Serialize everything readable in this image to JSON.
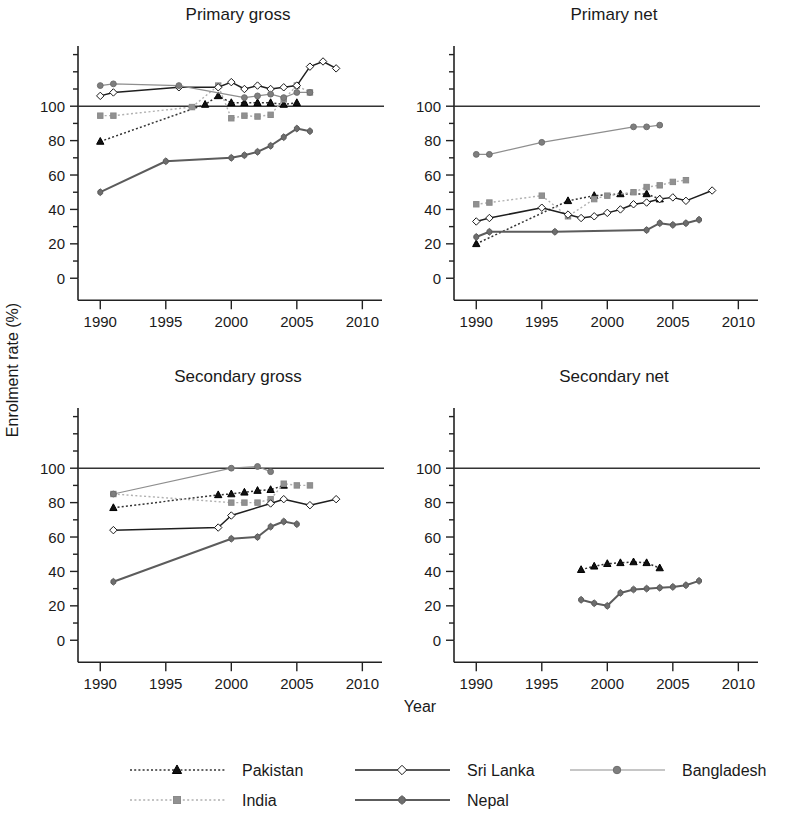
{
  "figure": {
    "ylabel": "Enrolment rate (%)",
    "xlabel": "Year"
  },
  "panels": [
    {
      "key": "primary_gross",
      "title": "Primary gross"
    },
    {
      "key": "primary_net",
      "title": "Primary net"
    },
    {
      "key": "secondary_gross",
      "title": "Secondary gross"
    },
    {
      "key": "secondary_net",
      "title": "Secondary net"
    }
  ],
  "legend": {
    "entries": [
      {
        "label": "Pakistan",
        "marker": "triangle",
        "marker_color": "#111111",
        "line_color": "#333333",
        "line_style": "dotted"
      },
      {
        "label": "Sri Lanka",
        "marker": "diamond",
        "marker_color": "#ffffff",
        "line_color": "#1a1a1a",
        "line_style": "solid"
      },
      {
        "label": "Bangladesh",
        "marker": "circle",
        "marker_color": "#7d7d7d",
        "line_color": "#8a8a8a",
        "line_style": "solid"
      },
      {
        "label": "India",
        "marker": "square",
        "marker_color": "#909090",
        "line_color": "#a8a8a8",
        "line_style": "dotted"
      },
      {
        "label": "Nepal",
        "marker": "sqdiamond",
        "marker_color": "#6f6f6f",
        "line_color": "#5f5f5f",
        "line_style": "solid"
      }
    ]
  },
  "axes": {
    "x_ticks": [
      1990,
      1995,
      2000,
      2005,
      2010
    ],
    "x_tick_labels": [
      "1990",
      "1995",
      "2000",
      "2005",
      "2010"
    ],
    "xlim": [
      1988.3,
      2011.5
    ],
    "y_ticks": [
      0,
      20,
      40,
      60,
      80,
      100
    ],
    "y_tick_labels": [
      "0",
      "20",
      "40",
      "60",
      "80",
      "100"
    ],
    "y_minor_ticks": [
      10,
      30,
      50,
      70,
      90,
      110,
      120,
      130
    ],
    "ylim": [
      -8,
      135
    ],
    "reference_line": 100
  },
  "chart_data": {
    "type": "line",
    "xlabel": "Year",
    "ylabel": "Enrolment rate (%)",
    "xlim": [
      1988.3,
      2011.5
    ],
    "ylim": [
      -8,
      135
    ],
    "grid": false,
    "legend_position": "bottom",
    "legend_entries": [
      "Pakistan",
      "India",
      "Sri Lanka",
      "Nepal",
      "Bangladesh"
    ],
    "reference_line_y": 100,
    "panels": [
      {
        "key": "primary_gross",
        "title": "Primary gross",
        "series": [
          {
            "name": "Pakistan",
            "x": [
              1990,
              1998,
              1999,
              2000,
              2001,
              2002,
              2003,
              2004,
              2005
            ],
            "values": [
              79.5,
              101,
              106,
              102,
              102,
              102,
              102,
              101,
              102
            ]
          },
          {
            "name": "India",
            "x": [
              1990,
              1991,
              1997,
              1999,
              2000,
              2001,
              2002,
              2003,
              2004,
              2005,
              2006
            ],
            "values": [
              94.5,
              94.5,
              99.5,
              112,
              93,
              94.5,
              94,
              95,
              104,
              112,
              108
            ]
          },
          {
            "name": "Sri Lanka",
            "x": [
              1990,
              1991,
              1996,
              1999,
              2000,
              2001,
              2002,
              2003,
              2004,
              2005,
              2006,
              2007,
              2008
            ],
            "values": [
              106,
              108,
              111,
              111,
              114,
              110,
              112,
              110,
              111,
              112,
              123,
              126,
              122
            ]
          },
          {
            "name": "Nepal",
            "x": [
              1990,
              1995,
              2000,
              2001,
              2002,
              2003,
              2004,
              2005,
              2006
            ],
            "values": [
              50,
              68,
              70,
              71.5,
              73.5,
              77,
              82,
              87,
              85.5
            ]
          },
          {
            "name": "Bangladesh",
            "x": [
              1990,
              1991,
              1996,
              2001,
              2002,
              2003,
              2004,
              2005,
              2006
            ],
            "values": [
              112,
              113,
              112,
              105,
              106,
              107,
              105,
              108,
              108
            ]
          }
        ]
      },
      {
        "key": "primary_net",
        "title": "Primary net",
        "series": [
          {
            "name": "Pakistan",
            "x": [
              1990,
              1997,
              1999,
              2001,
              2003,
              2004
            ],
            "values": [
              20,
              45,
              48,
              49,
              49,
              46
            ]
          },
          {
            "name": "India",
            "x": [
              1990,
              1991,
              1995,
              1997,
              1999,
              2000,
              2002,
              2003,
              2004,
              2005,
              2006
            ],
            "values": [
              43,
              44,
              48,
              36,
              46,
              48,
              50,
              53,
              54,
              56,
              57
            ]
          },
          {
            "name": "Sri Lanka",
            "x": [
              1990,
              1991,
              1995,
              1997,
              1998,
              1999,
              2000,
              2001,
              2002,
              2003,
              2004,
              2005,
              2006,
              2008
            ],
            "values": [
              33,
              35,
              41,
              37,
              35,
              36,
              38,
              40,
              43,
              44,
              46,
              47,
              45,
              51
            ]
          },
          {
            "name": "Nepal",
            "x": [
              1990,
              1991,
              1996,
              2003,
              2004,
              2005,
              2006,
              2007
            ],
            "values": [
              24,
              27,
              27,
              28,
              32,
              31,
              32,
              34
            ]
          },
          {
            "name": "Bangladesh",
            "x": [
              1990,
              1991,
              1995,
              2002,
              2003,
              2004
            ],
            "values": [
              72,
              72,
              79,
              88,
              88,
              89
            ]
          }
        ]
      },
      {
        "key": "secondary_gross",
        "title": "Secondary gross",
        "series": [
          {
            "name": "Pakistan",
            "x": [
              1991,
              1999,
              2000,
              2001,
              2002,
              2003,
              2004
            ],
            "values": [
              77,
              84.5,
              85,
              86,
              87,
              87.5,
              90
            ]
          },
          {
            "name": "India",
            "x": [
              1991,
              2000,
              2001,
              2002,
              2003,
              2004,
              2005,
              2006
            ],
            "values": [
              85,
              80,
              80,
              80,
              82,
              91,
              90,
              90
            ]
          },
          {
            "name": "Sri Lanka",
            "x": [
              1991,
              1999,
              2000,
              2003,
              2004,
              2006,
              2008
            ],
            "values": [
              64,
              65.5,
              72.5,
              79.5,
              82,
              78.5,
              82
            ]
          },
          {
            "name": "Nepal",
            "x": [
              1991,
              2000,
              2002,
              2003,
              2004,
              2005
            ],
            "values": [
              34,
              59,
              60,
              66,
              69,
              67.5
            ]
          },
          {
            "name": "Bangladesh",
            "x": [
              1991,
              2000,
              2002,
              2003
            ],
            "values": [
              85,
              100,
              101,
              98
            ]
          }
        ]
      },
      {
        "key": "secondary_net",
        "title": "Secondary net",
        "series": [
          {
            "name": "Pakistan",
            "x": [
              1998,
              1999,
              2000,
              2001,
              2002,
              2003,
              2004
            ],
            "values": [
              41,
              43,
              44.5,
              45,
              45.5,
              45,
              42
            ]
          },
          {
            "name": "Nepal",
            "x": [
              1998,
              1999,
              2000,
              2001,
              2002,
              2003,
              2004,
              2005,
              2006,
              2007
            ],
            "values": [
              23.5,
              21.5,
              20,
              27.5,
              29.5,
              30,
              30.5,
              31,
              32,
              34.5
            ]
          }
        ]
      }
    ]
  }
}
